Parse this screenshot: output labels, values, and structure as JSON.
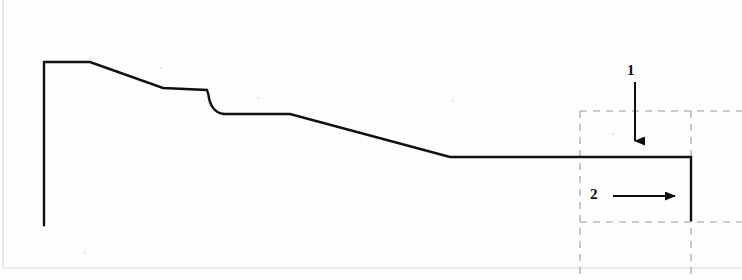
{
  "figure": {
    "type": "technical-line-drawing",
    "canvas": {
      "width": 742,
      "height": 280
    },
    "background_color": "#fefefe",
    "line_color": "#101010",
    "dashed_color": "#9a9a9a"
  },
  "profile": {
    "name": "main-profile-outline",
    "stroke_width": 2.4,
    "vertices": [
      {
        "x": 44,
        "y": 225,
        "note": "bottom of left vertical face"
      },
      {
        "x": 44,
        "y": 62,
        "note": "top-left corner"
      },
      {
        "x": 90,
        "y": 62,
        "note": "end of top flat crown"
      },
      {
        "x": 163,
        "y": 88,
        "note": "end of first descending slope"
      },
      {
        "x": 207,
        "y": 90,
        "note": "end of shelf before step"
      },
      {
        "x": 213,
        "y": 100,
        "note": "step shoulder start of fillet"
      },
      {
        "x": 224,
        "y": 114,
        "note": "step fillet bottom"
      },
      {
        "x": 290,
        "y": 114,
        "note": "end of second flat shelf"
      },
      {
        "x": 450,
        "y": 157,
        "note": "end of long descending slope"
      },
      {
        "x": 691,
        "y": 157,
        "note": "end of base flat run"
      },
      {
        "x": 691,
        "y": 220,
        "note": "bottom of right vertical face"
      }
    ]
  },
  "detail_box": {
    "name": "dashed-detail-region",
    "left": 580,
    "top": 111,
    "right": 691,
    "bottom": 222,
    "dash_pattern": "7 6",
    "stroke_width": 1.1,
    "extensions": {
      "top_line_extends_to_x": 742,
      "bottom_line_extends_to_x": 742,
      "vertical_lines_extend_to_y": 275
    }
  },
  "callouts": [
    {
      "id": "callout-1",
      "label": "1",
      "direction": "down",
      "label_position": {
        "x": 632,
        "y": 72
      },
      "arrow_start": {
        "x": 635,
        "y": 82
      },
      "arrow_end": {
        "x": 635,
        "y": 152
      },
      "stroke_width": 2.0
    },
    {
      "id": "callout-2",
      "label": "2",
      "direction": "right",
      "label_position": {
        "x": 595,
        "y": 195
      },
      "arrow_start": {
        "x": 613,
        "y": 196
      },
      "arrow_end": {
        "x": 686,
        "y": 196
      },
      "stroke_width": 2.0
    }
  ],
  "scan_artifacts": {
    "left_edge_line": {
      "x": 3,
      "y_from": 0,
      "y_to": 268,
      "color": "#d8d8d8"
    },
    "bottom_edge_line": {
      "y": 268,
      "x_from": 3,
      "x_to": 742,
      "color": "#d8d8d8"
    },
    "specks": [
      {
        "x": 160,
        "y": 67,
        "size": 2
      },
      {
        "x": 257,
        "y": 97,
        "size": 2
      },
      {
        "x": 452,
        "y": 100,
        "size": 2
      },
      {
        "x": 612,
        "y": 133,
        "size": 2
      },
      {
        "x": 84,
        "y": 252,
        "size": 2
      }
    ]
  }
}
